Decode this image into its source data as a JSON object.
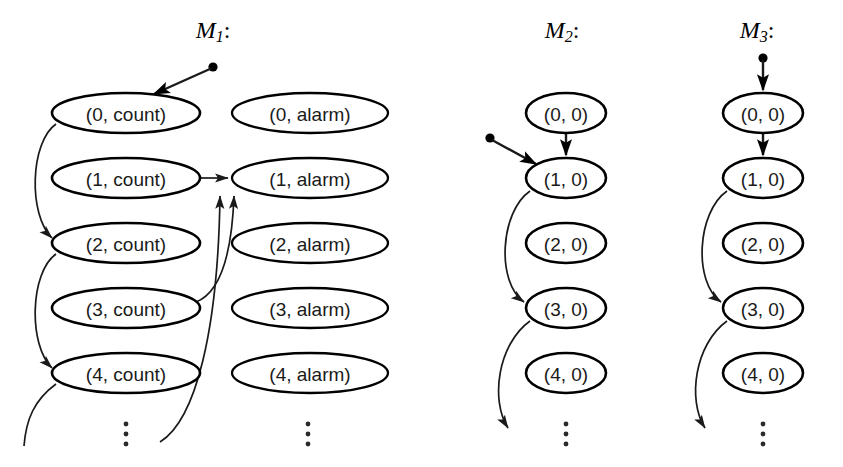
{
  "figure": {
    "width": 843,
    "height": 467,
    "background": "#ffffff",
    "stroke_color": "#000000",
    "label_color": "#1a1a1a"
  },
  "machines": [
    {
      "id": "M1",
      "title_main": "M",
      "title_sub": "1",
      "title_colon": ":",
      "title_x": 213,
      "title_y": 30,
      "columns": [
        {
          "id": "count-column",
          "cx": 126,
          "rx": 74,
          "ry": 20,
          "nodes": [
            {
              "label": "(0, count)",
              "cy": 113
            },
            {
              "label": "(1, count)",
              "cy": 178
            },
            {
              "label": "(2, count)",
              "cy": 243
            },
            {
              "label": "(3, count)",
              "cy": 308
            },
            {
              "label": "(4, count)",
              "cy": 373
            }
          ],
          "vdots_x": 126,
          "vdots_y": 432
        },
        {
          "id": "alarm-column",
          "cx": 310,
          "rx": 78,
          "ry": 20,
          "nodes": [
            {
              "label": "(0, alarm)",
              "cy": 113
            },
            {
              "label": "(1, alarm)",
              "cy": 178
            },
            {
              "label": "(2, alarm)",
              "cy": 243
            },
            {
              "label": "(3, alarm)",
              "cy": 308
            },
            {
              "label": "(4, alarm)",
              "cy": 373
            }
          ],
          "vdots_x": 308,
          "vdots_y": 432
        }
      ],
      "start_dot": {
        "x": 213,
        "y": 67
      },
      "start_arrow_to": {
        "x": 150,
        "y": 96
      }
    },
    {
      "id": "M2",
      "title_main": "M",
      "title_sub": "2",
      "title_colon": ":",
      "title_x": 562,
      "title_y": 30,
      "columns": [
        {
          "id": "m2-column",
          "cx": 566,
          "rx": 40,
          "ry": 20,
          "nodes": [
            {
              "label": "(0, 0)",
              "cy": 113
            },
            {
              "label": "(1, 0)",
              "cy": 178
            },
            {
              "label": "(2, 0)",
              "cy": 243
            },
            {
              "label": "(3, 0)",
              "cy": 308
            },
            {
              "label": "(4, 0)",
              "cy": 373
            }
          ],
          "vdots_x": 566,
          "vdots_y": 432
        }
      ],
      "start_dot": {
        "x": 490,
        "y": 138
      },
      "start_arrow_to": {
        "x": 535,
        "y": 163
      }
    },
    {
      "id": "M3",
      "title_main": "M",
      "title_sub": "3",
      "title_colon": ":",
      "title_x": 757,
      "title_y": 30,
      "columns": [
        {
          "id": "m3-column",
          "cx": 763,
          "rx": 40,
          "ry": 20,
          "nodes": [
            {
              "label": "(0, 0)",
              "cy": 113
            },
            {
              "label": "(1, 0)",
              "cy": 178
            },
            {
              "label": "(2, 0)",
              "cy": 243
            },
            {
              "label": "(3, 0)",
              "cy": 308
            },
            {
              "label": "(4, 0)",
              "cy": 373
            }
          ],
          "vdots_x": 763,
          "vdots_y": 432
        }
      ],
      "start_dot": {
        "x": 763,
        "y": 58
      },
      "start_arrow_to": {
        "x": 763,
        "y": 90
      }
    }
  ],
  "transitions": {
    "m1": [
      {
        "name": "count0-to-count2",
        "from": "(0, count)",
        "to": "(2, count)"
      },
      {
        "name": "count2-to-count4",
        "from": "(2, count)",
        "to": "(4, count)"
      },
      {
        "name": "count4-downward",
        "from": "(4, count)",
        "to": "below"
      },
      {
        "name": "count1-to-alarm1",
        "from": "(1, count)",
        "to": "(1, alarm)"
      },
      {
        "name": "count3-to-alarm1",
        "from": "(3, count)",
        "to": "(1, alarm)"
      },
      {
        "name": "below-to-alarm1",
        "from": "below",
        "to": "(1, alarm)"
      }
    ],
    "m2": [
      {
        "name": "state0-to-state1",
        "from": "(0, 0)",
        "to": "(1, 0)"
      },
      {
        "name": "state1-to-state3",
        "from": "(1, 0)",
        "to": "(3, 0)"
      },
      {
        "name": "state3-downward",
        "from": "(3, 0)",
        "to": "below"
      }
    ],
    "m3": [
      {
        "name": "state0-to-state1",
        "from": "(0, 0)",
        "to": "(1, 0)"
      },
      {
        "name": "state1-to-state3",
        "from": "(1, 0)",
        "to": "(3, 0)"
      },
      {
        "name": "state3-downward",
        "from": "(3, 0)",
        "to": "below"
      }
    ]
  }
}
